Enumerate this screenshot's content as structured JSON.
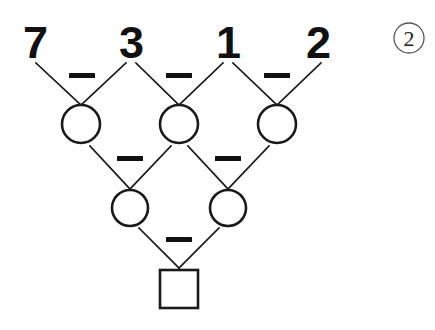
{
  "puzzle": {
    "type": "subtraction-pyramid",
    "background_color": "#ffffff",
    "ink_color": "#1a1a1a",
    "problem_marker": {
      "label": "2",
      "shape": "circle-outline",
      "name": "problem-number-2"
    },
    "top_row": {
      "name": "given-numbers-row",
      "values": [
        "7",
        "3",
        "1",
        "2"
      ]
    },
    "operators": {
      "symbol": "−",
      "row1_count": 3,
      "row2_count": 2,
      "row3_count": 1
    },
    "row2_answers": {
      "name": "answer-circles-row-2",
      "cells": [
        "",
        "",
        ""
      ]
    },
    "row3_answers": {
      "name": "answer-circles-row-3",
      "cells": [
        "",
        ""
      ]
    },
    "final_answer": {
      "name": "answer-square-final",
      "value": ""
    }
  },
  "geometry": {
    "top_digit_y": 58,
    "top_digit_x": [
      35,
      131,
      228,
      318
    ],
    "row2_circle_x": [
      81,
      179,
      277
    ],
    "row2_circle_y": 124,
    "row2_radius": 19,
    "row3_circle_x": [
      130,
      228
    ],
    "row3_circle_y": 208,
    "row3_radius": 18,
    "square_x": 160,
    "square_y": 270,
    "square_size": 38,
    "marker_cx": 409,
    "marker_cy": 38,
    "marker_r": 15
  }
}
